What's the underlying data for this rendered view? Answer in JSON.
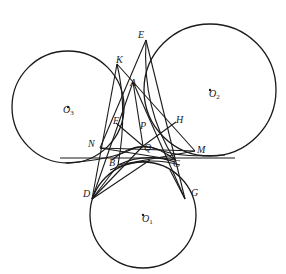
{
  "figure": {
    "type": "geometry-diagram",
    "stroke_color": "#1a1a1a",
    "background": "#ffffff",
    "circles": [
      {
        "id": "O1",
        "label": "O",
        "sub": "1",
        "cx": 143,
        "cy": 215,
        "r": 53,
        "label_x": 141,
        "label_y": 222
      },
      {
        "id": "O2",
        "label": "O",
        "sub": "2",
        "cx": 210,
        "cy": 90,
        "r": 66,
        "label_x": 209,
        "label_y": 97
      },
      {
        "id": "O3",
        "label": "O",
        "sub": "3",
        "cx": 68,
        "cy": 107,
        "r": 56,
        "label_x": 63,
        "label_y": 113
      }
    ],
    "points": [
      {
        "name": "K",
        "x": 117,
        "y": 64,
        "lx": 116,
        "ly": 63
      },
      {
        "name": "E",
        "x": 146,
        "y": 40,
        "lx": 138,
        "ly": 60
      },
      {
        "name": "A",
        "x": 133,
        "y": 82,
        "lx": 130,
        "ly": 86
      },
      {
        "name": "F",
        "x": 116,
        "y": 123,
        "lx": 114,
        "ly": 124
      },
      {
        "name": "P",
        "x": 148,
        "y": 131,
        "lx": 141,
        "ly": 130
      },
      {
        "name": "H",
        "x": 176,
        "y": 122,
        "lx": 176,
        "ly": 124
      },
      {
        "name": "N",
        "x": 100,
        "y": 148,
        "lx": 89,
        "ly": 147
      },
      {
        "name": "Q",
        "x": 143,
        "y": 146,
        "lx": 145,
        "ly": 150
      },
      {
        "name": "M",
        "x": 195,
        "y": 151,
        "lx": 197,
        "ly": 153
      },
      {
        "name": "B",
        "x": 118,
        "y": 165,
        "lx": 110,
        "ly": 164
      },
      {
        "name": "C",
        "x": 175,
        "y": 160,
        "lx": 174,
        "ly": 166
      },
      {
        "name": "D",
        "x": 92,
        "y": 199,
        "lx": 84,
        "ly": 193
      },
      {
        "name": "G",
        "x": 185,
        "y": 199,
        "lx": 192,
        "ly": 193
      }
    ],
    "tangent_line": {
      "x1": 40,
      "y1": 158,
      "x2": 255,
      "y2": 158
    }
  }
}
